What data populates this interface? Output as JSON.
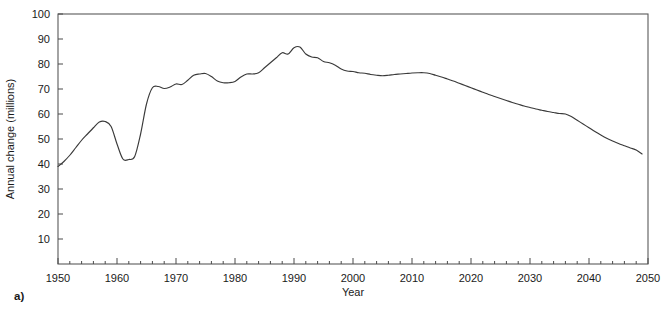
{
  "figure": {
    "panel_label": "a)"
  },
  "chart_data": {
    "type": "line",
    "title": "",
    "xlabel": "Year",
    "ylabel": "Annual change (millions)",
    "xlim": [
      1950,
      2050
    ],
    "ylim": [
      0,
      100
    ],
    "grid": false,
    "legend": null,
    "x_major_ticks": [
      1950,
      1960,
      1970,
      1980,
      1990,
      2000,
      2010,
      2020,
      2030,
      2040,
      2050
    ],
    "x_major_tick_labels": [
      "1950",
      "1960",
      "1970",
      "1980",
      "1990",
      "2000",
      "2010",
      "2020",
      "2030",
      "2040",
      "2050"
    ],
    "x_minor_tick_step": 2,
    "y_ticks": [
      10,
      20,
      30,
      40,
      50,
      60,
      70,
      80,
      90,
      100
    ],
    "y_tick_labels": [
      "10",
      "20",
      "30",
      "40",
      "50",
      "60",
      "70",
      "80",
      "90",
      "100"
    ],
    "series": [
      {
        "name": "Annual change",
        "x": [
          1950,
          1951,
          1952,
          1953,
          1954,
          1955,
          1956,
          1957,
          1958,
          1959,
          1960,
          1961,
          1962,
          1963,
          1964,
          1965,
          1966,
          1967,
          1968,
          1969,
          1970,
          1971,
          1972,
          1973,
          1974,
          1975,
          1976,
          1977,
          1978,
          1979,
          1980,
          1981,
          1982,
          1983,
          1984,
          1985,
          1986,
          1987,
          1988,
          1989,
          1990,
          1991,
          1992,
          1993,
          1994,
          1995,
          1996,
          1997,
          1998,
          1999,
          2000,
          2001,
          2002,
          2003,
          2004,
          2005,
          2006,
          2007,
          2008,
          2009,
          2010,
          2011,
          2012,
          2013,
          2014,
          2015,
          2016,
          2017,
          2018,
          2019,
          2020,
          2021,
          2022,
          2023,
          2024,
          2025,
          2026,
          2027,
          2028,
          2029,
          2030,
          2031,
          2032,
          2033,
          2034,
          2035,
          2036,
          2037,
          2038,
          2039,
          2040,
          2041,
          2042,
          2043,
          2044,
          2045,
          2046,
          2047,
          2048,
          2049
        ],
        "y": [
          39.0,
          41.0,
          43.5,
          46.5,
          49.5,
          52.0,
          54.5,
          56.8,
          57.0,
          55.0,
          48.0,
          42.0,
          41.8,
          43.0,
          52.0,
          64.0,
          70.5,
          71.0,
          70.2,
          70.8,
          72.0,
          71.8,
          73.5,
          75.5,
          76.0,
          76.2,
          75.0,
          73.2,
          72.5,
          72.5,
          73.0,
          74.8,
          76.0,
          76.0,
          76.5,
          78.5,
          80.5,
          82.5,
          84.5,
          84.0,
          86.5,
          86.8,
          84.0,
          82.8,
          82.5,
          81.0,
          80.5,
          79.5,
          78.0,
          77.2,
          77.0,
          76.5,
          76.3,
          75.8,
          75.5,
          75.3,
          75.5,
          75.8,
          76.0,
          76.2,
          76.4,
          76.5,
          76.5,
          76.2,
          75.5,
          74.8,
          74.0,
          73.2,
          72.3,
          71.4,
          70.5,
          69.6,
          68.7,
          67.8,
          67.0,
          66.2,
          65.4,
          64.6,
          63.9,
          63.2,
          62.6,
          62.0,
          61.5,
          61.0,
          60.6,
          60.2,
          60.0,
          59.0,
          57.5,
          56.0,
          54.5,
          53.0,
          51.6,
          50.3,
          49.2,
          48.2,
          47.3,
          46.4,
          45.6,
          44.0
        ]
      }
    ]
  }
}
